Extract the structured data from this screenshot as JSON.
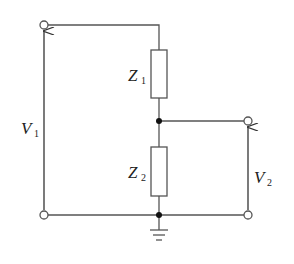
{
  "diagram": {
    "type": "voltage-divider-circuit",
    "colors": {
      "wire": "#555555",
      "junction": "#111111",
      "text": "#222222",
      "background": "#ffffff"
    },
    "labels": {
      "z1": {
        "main": "Z",
        "sub": "1"
      },
      "z2": {
        "main": "Z",
        "sub": "2"
      },
      "v1": {
        "main": "V",
        "sub": "1"
      },
      "v2": {
        "main": "V",
        "sub": "2"
      }
    },
    "components": [
      {
        "id": "Z1",
        "kind": "impedance",
        "position": "upper"
      },
      {
        "id": "Z2",
        "kind": "impedance",
        "position": "lower"
      }
    ],
    "terminals": [
      "input-top",
      "input-bottom",
      "output-top",
      "output-bottom"
    ],
    "voltages": [
      {
        "id": "V1",
        "across": "input terminals",
        "direction": "up"
      },
      {
        "id": "V2",
        "across": "output terminals",
        "direction": "up"
      }
    ],
    "ground": "bottom node"
  }
}
